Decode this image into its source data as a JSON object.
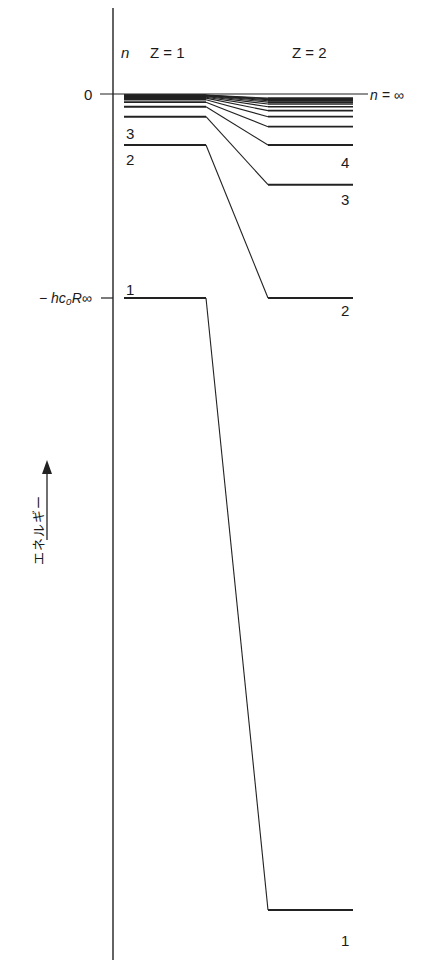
{
  "header": {
    "n_label": "n",
    "z1_label": "Z = 1",
    "z2_label": "Z = 2"
  },
  "axis": {
    "zero_label": "0",
    "hcR_label": "− hc₀R∞",
    "infinity_label": "n = ∞",
    "y_label": "エネルギー"
  },
  "levels": {
    "z1": [
      {
        "n": "1",
        "energy": -1.0
      },
      {
        "n": "2",
        "energy": -0.25
      },
      {
        "n": "3",
        "energy": -0.111
      }
    ],
    "z2": [
      {
        "n": "1",
        "energy": -4.0
      },
      {
        "n": "2",
        "energy": -1.0
      },
      {
        "n": "3",
        "energy": -0.444
      },
      {
        "n": "4",
        "energy": -0.25
      }
    ]
  },
  "chart_data": {
    "type": "energy-level-diagram",
    "title": "",
    "ylabel": "エネルギー",
    "y_reference_labels": [
      "0",
      "−hc₀R∞"
    ],
    "formula": "E_n = −hc₀R∞ · Z² / n²",
    "series": [
      {
        "name": "Z = 1",
        "n": [
          1,
          2,
          3,
          4,
          5,
          6,
          7,
          8
        ],
        "energy_units_hcR": [
          -1.0,
          -0.25,
          -0.111,
          -0.0625,
          -0.04,
          -0.0278,
          -0.0204,
          -0.0156
        ]
      },
      {
        "name": "Z = 2",
        "n": [
          1,
          2,
          3,
          4,
          5,
          6,
          7,
          8
        ],
        "energy_units_hcR": [
          -4.0,
          -1.0,
          -0.444,
          -0.25,
          -0.16,
          -0.111,
          -0.0816,
          -0.0625
        ]
      }
    ],
    "labeled_levels": {
      "Z = 1": [
        "1",
        "2",
        "3"
      ],
      "Z = 2": [
        "1",
        "2",
        "3",
        "4"
      ]
    },
    "limit_label": "n = ∞",
    "ylim": [
      -4.2,
      0.3
    ]
  }
}
